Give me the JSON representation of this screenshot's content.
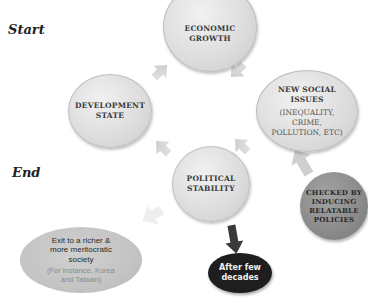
{
  "labels": {
    "start": "Start",
    "end": "End"
  },
  "nodes": {
    "economic_growth": {
      "line1": "ECONOMIC",
      "line2": "GROWTH"
    },
    "development_state": {
      "line1": "DEVELOPMENT",
      "line2": "STATE"
    },
    "new_social_issues": {
      "line1": "NEW SOCIAL",
      "line2": "ISSUES",
      "sub1": "(INEQUALITY,",
      "sub2": "CRIME,",
      "sub3": "POLLUTION, ETC)"
    },
    "political_stability": {
      "line1": "POLITICAL",
      "line2": "STABILITY"
    },
    "checked_by": {
      "line1": "CHECKED BY",
      "line2": "INDUCING",
      "line3": "RELATABLE",
      "line4": "POLICIES"
    },
    "after_few_decades": {
      "line1": "After few",
      "line2": "decades"
    },
    "exit": {
      "line1": "Exit to a richer &",
      "line2": "more meritocratic",
      "line3": "society",
      "sub1": "(For instance, Korea",
      "sub2": "and Taiwan)"
    }
  },
  "colors": {
    "light_node": "#dcdcdc",
    "checked_node": "#8a8a8a",
    "dark_node": "#1e1e1e",
    "exit_node": "#c4c4c4",
    "arrow_light": "#d4d4d4",
    "arrow_dark": "#3a3a3a"
  }
}
